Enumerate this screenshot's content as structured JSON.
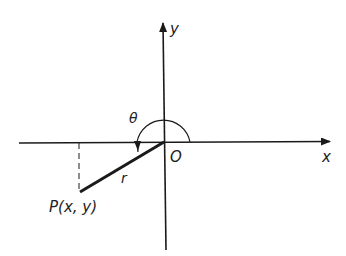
{
  "diagram": {
    "type": "polar-angle-diagram",
    "labels": {
      "y_axis": "y",
      "x_axis": "x",
      "origin": "O",
      "angle": "θ",
      "radius": "r",
      "point": "P(x, y)"
    },
    "colors": {
      "stroke": "#1a1a1a",
      "background": "#ffffff"
    }
  }
}
